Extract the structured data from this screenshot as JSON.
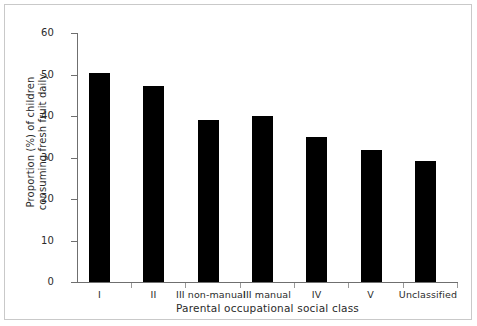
{
  "chart_data": {
    "type": "bar",
    "title": "",
    "xlabel": "Parental occupational social class",
    "ylabel": "Proportion (%) of children consuming fresh fruit daily",
    "ylabel_lines": [
      "Proportion (%) of children",
      "consuming fresh fruit daily"
    ],
    "categories": [
      "I",
      "II",
      "III non-manual",
      "III manual",
      "IV",
      "V",
      "Unclassified"
    ],
    "values": [
      50.3,
      47.3,
      39.0,
      40.0,
      35.0,
      31.7,
      29.2
    ],
    "ylim": [
      0,
      60
    ],
    "ytick_labels": [
      "0",
      "10",
      "20",
      "30",
      "40",
      "50",
      "60"
    ],
    "ytick_values": [
      0,
      10,
      20,
      30,
      40,
      50,
      60
    ],
    "grid": false,
    "legend": "none",
    "bar_color": "#000000",
    "axis_color": "#6f6f6f",
    "frame_color": "#c9c9c9",
    "text_color": "#2b2b2b"
  }
}
